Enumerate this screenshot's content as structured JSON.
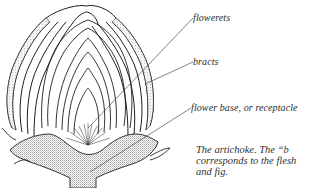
{
  "figure": {
    "labels": [
      {
        "id": "florets",
        "text": "flowerets"
      },
      {
        "id": "bracts",
        "text": "bracts"
      },
      {
        "id": "receptacle",
        "text": "flower base, or receptacle"
      }
    ],
    "caption": {
      "lines": [
        "The artichoke. The “b",
        "corresponds to the flesh",
        "and fig."
      ]
    },
    "colors": {
      "ink": "#1e1e1e",
      "label_text": "#2a2a2a",
      "background": "#ffffff"
    }
  }
}
